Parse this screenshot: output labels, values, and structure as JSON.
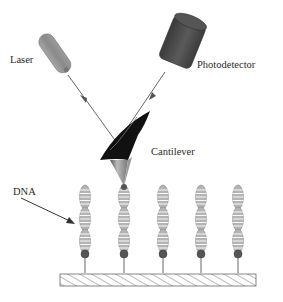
{
  "diagram": {
    "labels": {
      "laser": "Laser",
      "photodetector": "Photodetector",
      "cantilever": "Cantilever",
      "dna": "DNA"
    },
    "dna_strand_count": 5,
    "colors": {
      "laser_body": "#8c8c8c",
      "photodetector_body": "#4a4a4a",
      "cantilever": "#111111",
      "tip": "#9a9a9a",
      "beam": "#555555",
      "dna_fill": "#b8b8b8",
      "dna_stripe": "#ffffff",
      "anchor": "#555555",
      "substrate_hatch": "#777777"
    }
  }
}
